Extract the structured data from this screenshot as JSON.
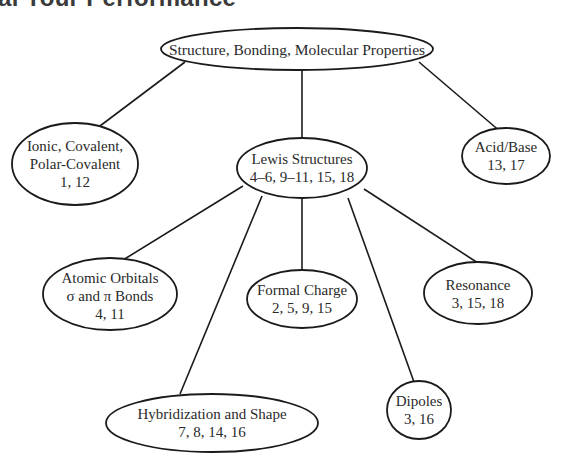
{
  "header": {
    "title_partial": "al Your Performance"
  },
  "diagram": {
    "type": "concept-map",
    "nodes": {
      "root": {
        "lines": [
          "Structure, Bonding, Molecular Properties"
        ]
      },
      "ionic": {
        "lines": [
          "Ionic, Covalent,",
          "Polar-Covalent",
          "1, 12"
        ]
      },
      "lewis": {
        "lines": [
          "Lewis Structures",
          "4–6, 9–11, 15, 18"
        ]
      },
      "acid_base": {
        "lines": [
          "Acid/Base",
          "13, 17"
        ]
      },
      "atomic_orbitals": {
        "lines": [
          "Atomic Orbitals",
          "σ and π Bonds",
          "4, 11"
        ]
      },
      "formal_charge": {
        "lines": [
          "Formal Charge",
          "2, 5, 9, 15"
        ]
      },
      "resonance": {
        "lines": [
          "Resonance",
          "3, 15, 18"
        ]
      },
      "hybridization": {
        "lines": [
          "Hybridization and Shape",
          "7, 8, 14, 16"
        ]
      },
      "dipoles": {
        "lines": [
          "Dipoles",
          "3, 16"
        ]
      }
    },
    "edges": [
      [
        "root",
        "ionic"
      ],
      [
        "root",
        "lewis"
      ],
      [
        "root",
        "acid_base"
      ],
      [
        "lewis",
        "atomic_orbitals"
      ],
      [
        "lewis",
        "hybridization"
      ],
      [
        "lewis",
        "formal_charge"
      ],
      [
        "lewis",
        "dipoles"
      ],
      [
        "lewis",
        "resonance"
      ]
    ]
  }
}
